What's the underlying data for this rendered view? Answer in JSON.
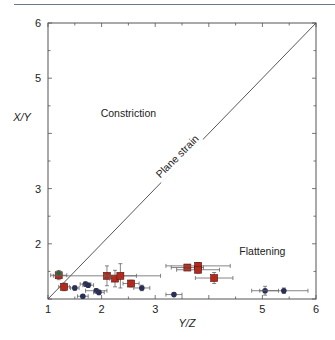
{
  "chart_data": {
    "type": "scatter",
    "title": "",
    "xlabel": "Y/Z",
    "ylabel": "X/Y",
    "xlim": [
      1,
      6
    ],
    "ylim": [
      1,
      6
    ],
    "x_ticks": [
      1,
      2,
      3,
      5,
      6
    ],
    "y_ticks": [
      2,
      3,
      5,
      6
    ],
    "x_tick_labels": [
      "1",
      "2",
      "3",
      "5",
      "6"
    ],
    "y_tick_labels": [
      "2",
      "3",
      "5",
      "6"
    ],
    "grid": false,
    "annotations": [
      {
        "text": "Constriction",
        "x": 2.5,
        "y": 4.3
      },
      {
        "text": "Plane strain",
        "x": 3.5,
        "y": 3.5,
        "rotation": -45
      },
      {
        "text": "Flattening",
        "x": 5.0,
        "y": 1.8
      }
    ],
    "reference_line": {
      "name": "Plane strain",
      "x": [
        1,
        6
      ],
      "y": [
        1,
        6
      ]
    },
    "series": [
      {
        "name": "red squares",
        "marker": "square",
        "color": "#b22a1e",
        "points": [
          {
            "x": 1.2,
            "y": 1.43,
            "xerr": 0.15,
            "yerr": 0.08
          },
          {
            "x": 1.3,
            "y": 1.22,
            "xerr": 0.1,
            "yerr": 0.07
          },
          {
            "x": 2.1,
            "y": 1.42,
            "xerr": 1.0,
            "yerr": 0.18
          },
          {
            "x": 2.25,
            "y": 1.37,
            "xerr": 0.1,
            "yerr": 0.15
          },
          {
            "x": 2.35,
            "y": 1.42,
            "xerr": 0.3,
            "yerr": 0.22
          },
          {
            "x": 2.55,
            "y": 1.28,
            "xerr": 0.15,
            "yerr": 0.06
          },
          {
            "x": 3.6,
            "y": 1.57,
            "xerr": 0.3,
            "yerr": 0.05
          },
          {
            "x": 3.8,
            "y": 1.6,
            "xerr": 0.6,
            "yerr": 0.06
          },
          {
            "x": 3.8,
            "y": 1.53,
            "xerr": 0.4,
            "yerr": 0.06
          },
          {
            "x": 4.1,
            "y": 1.38,
            "xerr": 0.35,
            "yerr": 0.1
          }
        ]
      },
      {
        "name": "blue circles",
        "marker": "circle",
        "color": "#2a2f55",
        "points": [
          {
            "x": 1.5,
            "y": 1.2,
            "xerr": 0.08,
            "yerr": 0.04
          },
          {
            "x": 1.65,
            "y": 1.05,
            "xerr": 0.1,
            "yerr": 0.03
          },
          {
            "x": 1.7,
            "y": 1.27,
            "xerr": 0.1,
            "yerr": 0.04
          },
          {
            "x": 1.75,
            "y": 1.25,
            "xerr": 0.1,
            "yerr": 0.04
          },
          {
            "x": 1.9,
            "y": 1.15,
            "xerr": 0.2,
            "yerr": 0.04
          },
          {
            "x": 1.95,
            "y": 1.12,
            "xerr": 0.1,
            "yerr": 0.04
          },
          {
            "x": 2.75,
            "y": 1.2,
            "xerr": 0.15,
            "yerr": 0.05
          },
          {
            "x": 3.35,
            "y": 1.08,
            "xerr": 0.15,
            "yerr": 0.03
          },
          {
            "x": 5.05,
            "y": 1.15,
            "xerr": 0.25,
            "yerr": 0.08
          },
          {
            "x": 5.4,
            "y": 1.15,
            "xerr": 0.45,
            "yerr": 0.05
          }
        ]
      },
      {
        "name": "green marker",
        "marker": "diamond",
        "color": "#1e6b3a",
        "points": [
          {
            "x": 1.2,
            "y": 1.47,
            "xerr": 0.05,
            "yerr": 0.04
          }
        ]
      }
    ]
  }
}
